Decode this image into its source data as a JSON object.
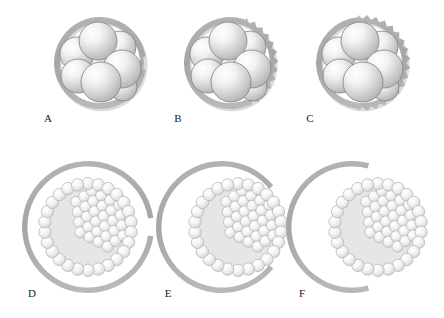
{
  "figure": {
    "background_color": "#ffffff",
    "width": 444,
    "height": 318,
    "rows": 2,
    "columns": 3
  },
  "colors": {
    "zona": "#a9a9a9",
    "zona_shadow": "#bdbdbd",
    "cell_outline": "#808080",
    "cell_light": "#ffffff",
    "cell_mid": "#d8d8d8",
    "cell_dark": "#b0b0b0",
    "blastocoel": "#e6e6e6",
    "trophoblast_outline": "#b5b5b5",
    "label_color": "#1a1a1a"
  },
  "panels": [
    {
      "id": "A",
      "label": "A",
      "stage": "cleavage-stage embryo",
      "zona_state": "intact smooth zona with small indentation",
      "zona_edge": "smooth",
      "gap_degrees": 0,
      "serration": "none",
      "blastomere_count": 8,
      "cx": 100,
      "cy": 63,
      "zona_radius": 46,
      "label_x": 48,
      "label_y": 122
    },
    {
      "id": "B",
      "label": "B",
      "stage": "cleavage-stage embryo",
      "zona_state": "zona partially thinned with serrated outer edge",
      "zona_edge": "serrated",
      "gap_degrees": 0,
      "serration": "partial",
      "serration_start_deg": -70,
      "serration_end_deg": 65,
      "blastomere_count": 8,
      "cx": 230,
      "cy": 63,
      "zona_radius": 46,
      "label_x": 178,
      "label_y": 122
    },
    {
      "id": "C",
      "label": "C",
      "stage": "cleavage-stage embryo",
      "zona_state": "zona extensively thinned with wide serrated edge",
      "zona_edge": "serrated",
      "gap_degrees": 0,
      "serration": "extensive",
      "serration_start_deg": -95,
      "serration_end_deg": 95,
      "blastomere_count": 8,
      "cx": 362,
      "cy": 63,
      "zona_radius": 46,
      "label_x": 310,
      "label_y": 122
    },
    {
      "id": "D",
      "label": "D",
      "stage": "blastocyst",
      "zona_state": "zona breached with narrow gap",
      "zona_edge": "smooth",
      "gap_degrees": 16,
      "serration": "none",
      "trophoblast_cells": 26,
      "cx": 88,
      "cy": 227,
      "zona_radius": 66,
      "blastocyst_cx": 88,
      "blastocyst_cy": 227,
      "blastocyst_radius": 48,
      "label_x": 32,
      "label_y": 297
    },
    {
      "id": "E",
      "label": "E",
      "stage": "hatching blastocyst",
      "zona_state": "zona open, blastocyst partially extruded",
      "zona_edge": "smooth",
      "gap_degrees": 78,
      "serration": "none",
      "trophoblast_cells": 26,
      "cx": 222,
      "cy": 227,
      "zona_radius": 66,
      "blastocyst_cx": 238,
      "blastocyst_cy": 227,
      "blastocyst_radius": 48,
      "label_x": 168,
      "label_y": 297
    },
    {
      "id": "F",
      "label": "F",
      "stage": "hatched blastocyst",
      "zona_state": "zona reduced to crescent, blastocyst escaped",
      "zona_edge": "smooth",
      "gap_degrees": 150,
      "serration": "none",
      "trophoblast_cells": 26,
      "cx": 352,
      "cy": 227,
      "zona_radius": 66,
      "blastocyst_cx": 378,
      "blastocyst_cy": 227,
      "blastocyst_radius": 48,
      "label_x": 302,
      "label_y": 297
    }
  ],
  "blastomere_layout": {
    "description": "Eight-cell embryo rendered as overlapping shaded spheres",
    "cells": [
      {
        "dx": -2,
        "dy": -22,
        "r": 19,
        "z": 5
      },
      {
        "dx": 20,
        "dy": -16,
        "r": 16,
        "z": 2
      },
      {
        "dx": -23,
        "dy": -9,
        "r": 17,
        "z": 3
      },
      {
        "dx": 22,
        "dy": 6,
        "r": 19,
        "z": 6
      },
      {
        "dx": -22,
        "dy": 13,
        "r": 17,
        "z": 4
      },
      {
        "dx": 1,
        "dy": 19,
        "r": 20,
        "z": 7
      },
      {
        "dx": -4,
        "dy": -1,
        "r": 16,
        "z": 1
      },
      {
        "dx": 23,
        "dy": 24,
        "r": 14,
        "z": 0
      }
    ]
  },
  "blastocyst_layout": {
    "trophoblast_cell_radius": 6.2,
    "trophoblast_ring_count": 26,
    "inner_cell_mass": {
      "description": "Inner cell mass cluster positioned at upper-right of cavity",
      "angle_deg": -35,
      "cell_radius": 5.6,
      "cell_count": 34
    },
    "blastocoel": {
      "description": "Fluid-filled cavity occupying lower-left of blastocyst"
    }
  }
}
